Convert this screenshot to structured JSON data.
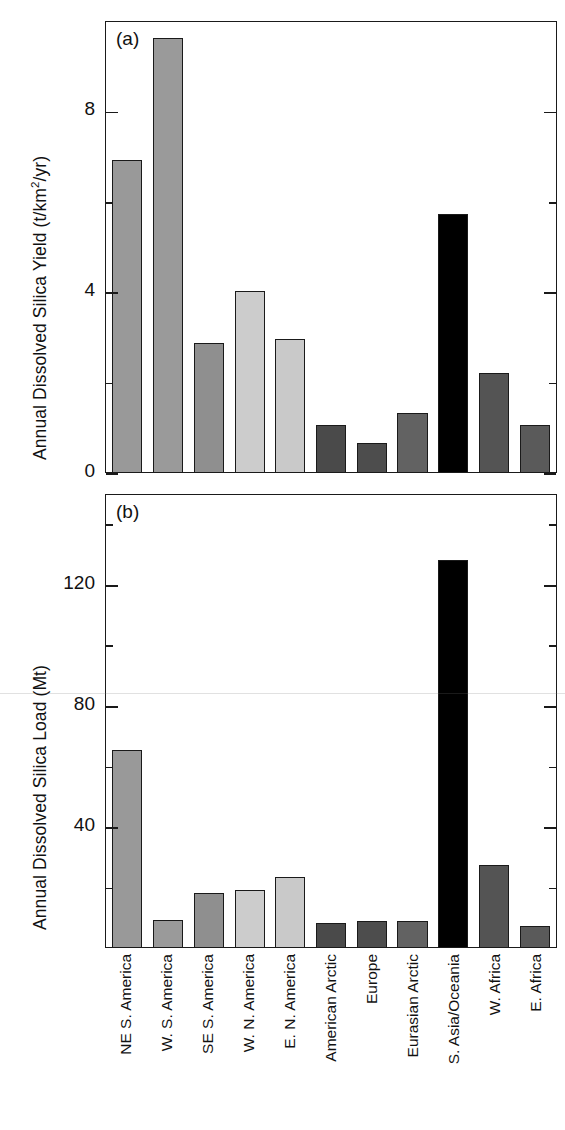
{
  "figure": {
    "background": "#ffffff",
    "panel_tags": [
      "(a)",
      "(b)"
    ]
  },
  "chart_data": [
    {
      "type": "bar",
      "panel": "(a)",
      "title": "",
      "ylabel": "Annual Dissolved Silica Yield (t/km2/yr)",
      "ylabel_display": "Annual Dissolved Silica Yield (t/km",
      "ylabel_sup": "2",
      "ylabel_tail": "/yr)",
      "xlabel": "",
      "ylim": [
        0,
        10
      ],
      "yticks_major": [
        0,
        4,
        8
      ],
      "yticks_major_labels": [
        "0",
        "4",
        "8"
      ],
      "yticks_minor": [
        2,
        6
      ],
      "grid": false,
      "legend": "none",
      "categories": [
        "NE S. America",
        "W. S. America",
        "SE S. America",
        "W. N. America",
        "E. N. America",
        "American Arctic",
        "Europe",
        "Eurasian Arctic",
        "S. Asia/Oceania",
        "W. Africa",
        "E. Africa"
      ],
      "values": [
        6.9,
        9.6,
        2.85,
        4.0,
        2.95,
        1.05,
        0.65,
        1.3,
        5.7,
        2.2,
        1.05
      ],
      "colors": [
        "#999999",
        "#9a9a9a",
        "#8f8f8f",
        "#cccccc",
        "#c9c9c9",
        "#4a4a4a",
        "#4d4d4d",
        "#626262",
        "#000000",
        "#545454",
        "#5a5a5a"
      ]
    },
    {
      "type": "bar",
      "panel": "(b)",
      "title": "",
      "ylabel": "Annual Dissolved Silica Load (Mt)",
      "xlabel": "",
      "ylim": [
        0,
        150
      ],
      "yticks_major": [
        40,
        80,
        120
      ],
      "yticks_major_labels": [
        "40",
        "80",
        "120"
      ],
      "yticks_minor": [
        20,
        60,
        100,
        140
      ],
      "grid": false,
      "legend": "none",
      "categories": [
        "NE S. America",
        "W. S. America",
        "SE S. America",
        "W. N. America",
        "E. N. America",
        "American Arctic",
        "Europe",
        "Eurasian Arctic",
        "S. Asia/Oceania",
        "W. Africa",
        "E. Africa"
      ],
      "values": [
        65,
        9,
        18,
        19,
        23,
        8,
        8.5,
        8.5,
        128,
        27,
        7
      ],
      "colors": [
        "#999999",
        "#9a9a9a",
        "#8f8f8f",
        "#cccccc",
        "#c9c9c9",
        "#4a4a4a",
        "#4d4d4d",
        "#626262",
        "#000000",
        "#545454",
        "#5a5a5a"
      ]
    }
  ]
}
